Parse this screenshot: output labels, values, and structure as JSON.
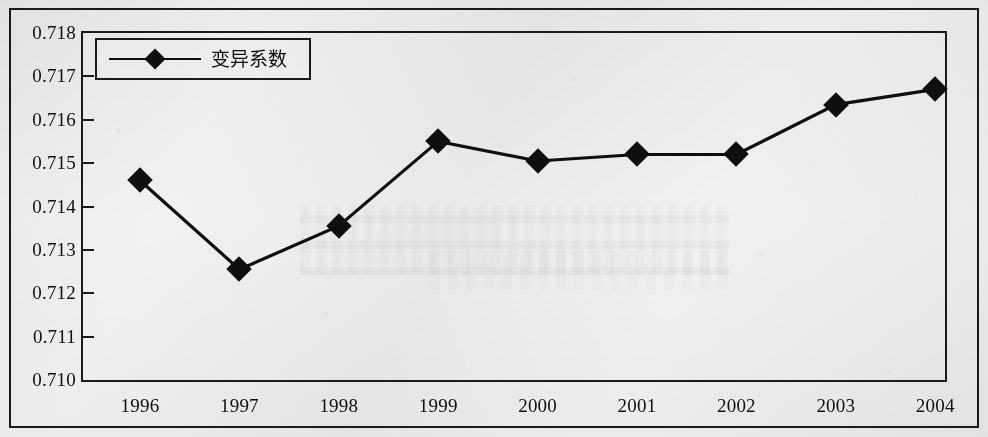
{
  "figure": {
    "border_color": "#1c1c1c",
    "background_color": "#edecea"
  },
  "legend": {
    "label": "变异系数",
    "marker": "filled-diamond",
    "position": "top-left-inside"
  },
  "y_axis": {
    "ticks": [
      "0.718",
      "0.717",
      "0.716",
      "0.715",
      "0.714",
      "0.713",
      "0.712",
      "0.711",
      "0.710"
    ]
  },
  "x_axis": {
    "ticks": [
      "1996",
      "1997",
      "1998",
      "1999",
      "2000",
      "2001",
      "2002",
      "2003",
      "2004"
    ]
  },
  "chart_data": {
    "type": "line",
    "title": "",
    "subtitle": "",
    "xlabel": "",
    "ylabel": "",
    "categories": [
      "1996",
      "1997",
      "1998",
      "1999",
      "2000",
      "2001",
      "2002",
      "2003",
      "2004"
    ],
    "series": [
      {
        "name": "变异系数",
        "marker": "filled-diamond",
        "color": "#111111",
        "values": [
          0.7146,
          0.71255,
          0.71355,
          0.7155,
          0.71505,
          0.7152,
          0.7152,
          0.71635,
          0.7167
        ]
      }
    ],
    "ylim": [
      0.71,
      0.718
    ],
    "ytick_step": 0.001,
    "ytick_labels": [
      "0.710",
      "0.711",
      "0.712",
      "0.713",
      "0.714",
      "0.715",
      "0.716",
      "0.717",
      "0.718"
    ],
    "xtick_labels": [
      "1996",
      "1997",
      "1998",
      "1999",
      "2000",
      "2001",
      "2002",
      "2003",
      "2004"
    ],
    "grid": false,
    "legend_position": "upper left",
    "legend_entries": [
      "变异系数"
    ]
  }
}
